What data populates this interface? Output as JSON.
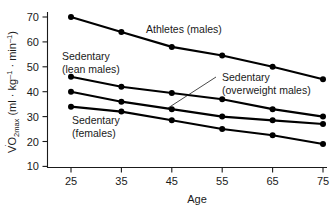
{
  "chart_data": {
    "type": "line",
    "title": "",
    "xlabel": "Age",
    "ylabel": "VO2max (ml · kg⁻¹ · min⁻¹)",
    "ylabel_parts": {
      "v_dot": "V",
      "o": "O",
      "sub": "2max",
      "units": " (ml · kg",
      "sup1": "–1",
      "mid": " · min",
      "sup2": "–1",
      "close": ")"
    },
    "x": [
      25,
      35,
      45,
      55,
      65,
      75
    ],
    "xtick_labels": [
      "25",
      "35",
      "45",
      "55",
      "65",
      "75"
    ],
    "ytick_labels": [
      "10",
      "20",
      "30",
      "40",
      "50",
      "60",
      "70"
    ],
    "yticks": [
      10,
      20,
      30,
      40,
      50,
      60,
      70
    ],
    "xlim": [
      20,
      80
    ],
    "ylim": [
      10,
      72
    ],
    "grid": false,
    "legend_position": "inline-annotations",
    "marker": "filled-circle",
    "line_color": "#000000",
    "series": [
      {
        "name": "Athletes (males)",
        "label_lines": [
          "Athletes (males)"
        ],
        "values": [
          70,
          64,
          58,
          54.5,
          50,
          45
        ]
      },
      {
        "name": "Sedentary (lean males)",
        "label_lines": [
          "Sedentary",
          "(lean males)"
        ],
        "values": [
          46,
          42,
          39.5,
          37,
          33,
          30
        ]
      },
      {
        "name": "Sedentary (overweight males)",
        "label_lines": [
          "Sedentary",
          "(overweight males)"
        ],
        "values": [
          40,
          36,
          33,
          30,
          28.5,
          27
        ]
      },
      {
        "name": "Sedentary (females)",
        "label_lines": [
          "Sedentary",
          "(females)"
        ],
        "values": [
          34,
          32,
          28.5,
          25,
          22.5,
          19
        ]
      }
    ]
  },
  "annotations": {
    "athletes": "Athletes (males)",
    "lean_line1": "Sedentary",
    "lean_line2": "(lean males)",
    "overweight_line1": "Sedentary",
    "overweight_line2": "(overweight males)",
    "females_line1": "Sedentary",
    "females_line2": "(females)"
  }
}
